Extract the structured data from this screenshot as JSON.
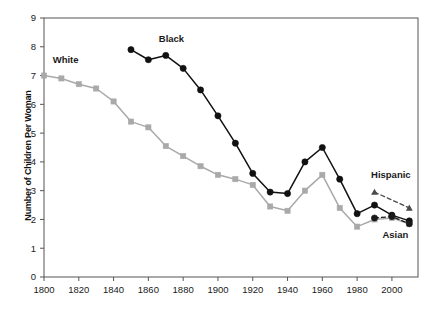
{
  "chart_data": {
    "type": "line",
    "title": "",
    "xlabel": "",
    "ylabel": "Number of Children Per Woman",
    "xlim": [
      1800,
      2015
    ],
    "ylim": [
      0,
      9
    ],
    "grid": false,
    "legend_position": "inline-annotations",
    "xticks": [
      1800,
      1820,
      1840,
      1860,
      1880,
      1900,
      1920,
      1940,
      1960,
      1980,
      2000
    ],
    "yticks": [
      0,
      1,
      2,
      3,
      4,
      5,
      6,
      7,
      8,
      9
    ],
    "series": [
      {
        "name": "White",
        "color": "#a9a9a9",
        "marker": "square",
        "linestyle": "solid",
        "label_x": 1805,
        "label_y": 7.45,
        "x": [
          1800,
          1810,
          1820,
          1830,
          1840,
          1850,
          1860,
          1870,
          1880,
          1890,
          1900,
          1910,
          1920,
          1930,
          1940,
          1950,
          1960,
          1970,
          1980,
          1990,
          2000,
          2010
        ],
        "values": [
          7.0,
          6.9,
          6.7,
          6.55,
          6.1,
          5.4,
          5.2,
          4.55,
          4.2,
          3.85,
          3.55,
          3.4,
          3.2,
          2.45,
          2.3,
          3.0,
          3.55,
          2.4,
          1.75,
          2.0,
          2.05,
          1.85
        ]
      },
      {
        "name": "Black",
        "color": "#111111",
        "marker": "circle",
        "linestyle": "solid",
        "label_x": 1866,
        "label_y": 8.15,
        "x": [
          1850,
          1860,
          1870,
          1880,
          1890,
          1900,
          1910,
          1920,
          1930,
          1940,
          1950,
          1960,
          1970,
          1980,
          1990,
          2000,
          2010
        ],
        "values": [
          7.9,
          7.55,
          7.7,
          7.25,
          6.5,
          5.6,
          4.65,
          3.6,
          2.95,
          2.9,
          4.0,
          4.5,
          3.4,
          2.2,
          2.5,
          2.15,
          1.95
        ]
      },
      {
        "name": "Hispanic",
        "color": "#4a4a4a",
        "marker": "triangle",
        "linestyle": "dashed",
        "label_x": 1988,
        "label_y": 3.45,
        "x": [
          1990,
          2010
        ],
        "values": [
          2.95,
          2.4
        ]
      },
      {
        "name": "Asian",
        "color": "#1a1a1a",
        "marker": "circle",
        "linestyle": "dashed",
        "label_x": 2002,
        "label_y": 1.35,
        "x": [
          1990,
          2000,
          2010
        ],
        "values": [
          2.05,
          2.1,
          1.85
        ]
      }
    ]
  },
  "axes": {
    "y_title": "Number of Children Per Woman"
  },
  "style": {
    "frame_color": "#555555",
    "text_color": "#111111",
    "gray_series": "#a9a9a9",
    "black_series": "#111111",
    "background": "#ffffff"
  }
}
